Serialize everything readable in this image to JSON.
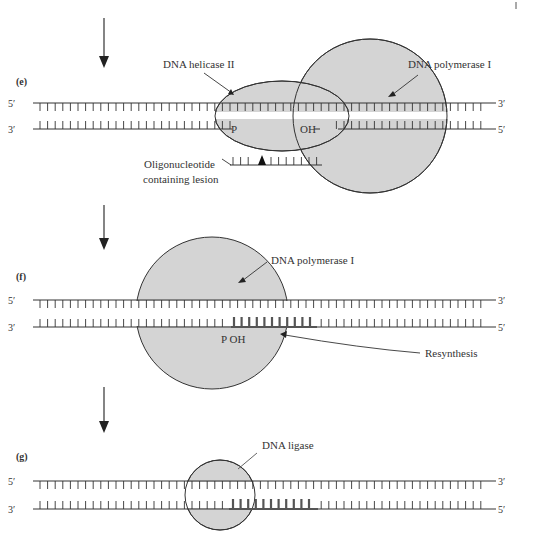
{
  "panels": [
    {
      "id": "e",
      "label": "(e)",
      "strand_top_left": "5′",
      "strand_top_right": "3′",
      "strand_bottom_left": "3′",
      "strand_bottom_right": "5′",
      "enzyme_1": "DNA helicase II",
      "enzyme_2": "DNA polymerase I",
      "end_p": "P",
      "end_oh": "OH",
      "fragment_label_line1": "Oligonucleotide",
      "fragment_label_line2": "containing lesion"
    },
    {
      "id": "f",
      "label": "(f)",
      "strand_top_left": "5′",
      "strand_top_right": "3′",
      "strand_bottom_left": "3′",
      "strand_bottom_right": "5′",
      "enzyme": "DNA polymerase I",
      "ends": "P OH",
      "process": "Resynthesis"
    },
    {
      "id": "g",
      "label": "(g)",
      "strand_top_left": "5′",
      "strand_top_right": "3′",
      "strand_bottom_left": "3′",
      "strand_bottom_right": "5′",
      "enzyme": "DNA ligase"
    }
  ],
  "colors": {
    "enzyme_fill": "#d4d4d4",
    "line": "#333333",
    "new_strand": "#555555"
  }
}
